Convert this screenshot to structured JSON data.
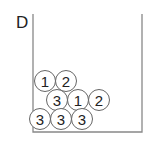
{
  "diagram": {
    "label": "D",
    "container": {
      "left": 33,
      "right": 142,
      "top": 14,
      "bottom": 132,
      "stroke": "#888888"
    },
    "ball_radius": 10.5,
    "ball_stroke": "#666666",
    "balls": [
      {
        "row": 1,
        "cx": 45,
        "cy": 81,
        "value": "1"
      },
      {
        "row": 1,
        "cx": 66,
        "cy": 81,
        "value": "2"
      },
      {
        "row": 2,
        "cx": 57,
        "cy": 100,
        "value": "3"
      },
      {
        "row": 2,
        "cx": 78,
        "cy": 100,
        "value": "1"
      },
      {
        "row": 2,
        "cx": 99,
        "cy": 100,
        "value": "2"
      },
      {
        "row": 3,
        "cx": 40,
        "cy": 119,
        "value": "3"
      },
      {
        "row": 3,
        "cx": 61,
        "cy": 119,
        "value": "3"
      },
      {
        "row": 3,
        "cx": 82,
        "cy": 119,
        "value": "3"
      }
    ]
  }
}
